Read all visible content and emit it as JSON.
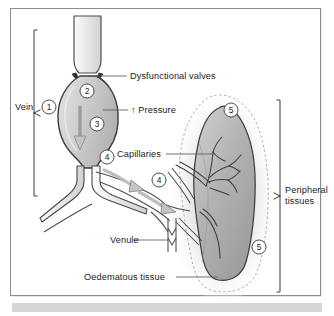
{
  "figure": {
    "background_color": "#ffffff",
    "frame_color": "#8d8d8d",
    "footer_bar_color": "#d6d6d6"
  },
  "labels": {
    "vein": "Vein",
    "dysfunctional_valves": "Dysfunctional valves",
    "pressure": "↑ Pressure",
    "capillaries": "Capillaries",
    "venule": "Venule",
    "oedematous_tissue": "Oedematous tissue",
    "peripheral_tissues_line1": "Peripheral",
    "peripheral_tissues_line2": "tissues"
  },
  "callouts": [
    {
      "id": "1",
      "label": "1",
      "meaning": "vein wall"
    },
    {
      "id": "2",
      "label": "2",
      "meaning": "dysfunctional valve cusps"
    },
    {
      "id": "3",
      "label": "3",
      "meaning": "increased venous pressure / reflux"
    },
    {
      "id": "4",
      "label": "4",
      "meaning": "flow into tributaries"
    },
    {
      "id": "4b",
      "label": "4",
      "meaning": "flow toward venule"
    },
    {
      "id": "5",
      "label": "5",
      "meaning": "oedema halo upper"
    },
    {
      "id": "5b",
      "label": "5",
      "meaning": "oedema halo lower"
    }
  ],
  "colors": {
    "vessel_outline": "#4a4a4a",
    "vessel_fill_light": "#f4f4f4",
    "vessel_fill_mid": "#d8d8d8",
    "varix_fill": "#c9c9c9",
    "valve_dark": "#3a3a3a",
    "tissue_fill": "#b4b4b4",
    "tissue_outline": "#3f3f3f",
    "oedema_dash": "#9a9a9a",
    "oedema_glow": "#ebebeb",
    "leader_line": "#5a5a5a",
    "bracket": "#3a3a3a",
    "text": "#1c1c1c"
  },
  "brackets": {
    "vein_bracket": {
      "orientation": "left",
      "top": 30,
      "bottom": 196
    },
    "peripheral_bracket": {
      "orientation": "right",
      "top": 100,
      "bottom": 292
    }
  }
}
